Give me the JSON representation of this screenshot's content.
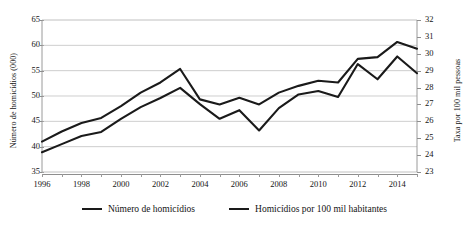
{
  "chart_data": {
    "type": "line",
    "title": "",
    "xlabel": "",
    "ylabel": "Número de homicídios (000)",
    "y2label": "Taxa  por 100 mil pessoas",
    "grid": true,
    "legend_position": "bottom",
    "x": [
      1996,
      1997,
      1998,
      1999,
      2000,
      2001,
      2002,
      2003,
      2004,
      2005,
      2006,
      2007,
      2008,
      2009,
      2010,
      2011,
      2012,
      2013,
      2014,
      2015
    ],
    "xlim": [
      1996,
      2015
    ],
    "xticks": [
      1996,
      1998,
      2000,
      2002,
      2004,
      2006,
      2008,
      2010,
      2012,
      2014
    ],
    "xtick_labels": [
      "1996",
      "1998",
      "2000",
      "2002",
      "2004",
      "2006",
      "2008",
      "2010",
      "2012",
      "2014"
    ],
    "ylim": [
      35,
      65
    ],
    "yticks": [
      35,
      40,
      45,
      50,
      55,
      60,
      65
    ],
    "ytick_labels": [
      "35",
      "40",
      "45",
      "50",
      "55",
      "60",
      "65"
    ],
    "y2lim": [
      23,
      32
    ],
    "y2ticks": [
      23,
      24,
      25,
      26,
      27,
      28,
      29,
      30,
      31,
      32
    ],
    "y2tick_labels": [
      "23",
      "24",
      "25",
      "26",
      "27",
      "28",
      "29",
      "30",
      "31",
      "32"
    ],
    "series": [
      {
        "name": "Número de homicídios",
        "axis": "left",
        "color": "#1a1a1a",
        "values": [
          38.9,
          40.5,
          42.1,
          42.9,
          45.5,
          47.8,
          49.6,
          51.6,
          48.4,
          45.5,
          47.2,
          43.2,
          47.6,
          50.3,
          51.0,
          49.8,
          56.3,
          53.3,
          57.8,
          54.5
        ]
      },
      {
        "name": "Homicídios por 100 mil habitantes",
        "axis": "right",
        "color": "#1a1a1a",
        "values": [
          24.8,
          25.4,
          25.9,
          26.2,
          26.9,
          27.7,
          28.3,
          29.1,
          27.3,
          27.0,
          27.4,
          27.0,
          27.7,
          28.1,
          28.4,
          28.3,
          29.7,
          29.8,
          30.7,
          30.3
        ]
      }
    ]
  },
  "legend": {
    "items": [
      {
        "label": "Número de homicídios"
      },
      {
        "label": "Homicídios por 100 mil habitantes"
      }
    ]
  }
}
